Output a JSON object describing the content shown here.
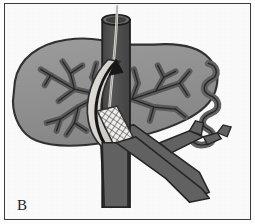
{
  "figure": {
    "panel_label": "B",
    "caption_text": "",
    "type": "grayscale medical line illustration",
    "background_color": "#fbfbfb",
    "frame_color": "#3b3b3b"
  },
  "palette": {
    "liver_fill": "#8f8f8f",
    "liver_outline": "#2e2e2e",
    "vessel_fill": "#5d5d5d",
    "vessel_outline": "#222222",
    "ivc_fill": "#4a4a4a",
    "ivc_outline": "#1c1c1c",
    "shunt_tract_fill": "#d8d6d0",
    "shunt_tract_outline": "#2a2a2a",
    "arrow_color": "#111111",
    "stent_mesh_fill": "#efeeea",
    "stent_mesh_line": "#2b2b2b",
    "guidewire_color": "#dedcd6",
    "page_white": "#ffffff"
  },
  "structures": [
    {
      "id": "liver",
      "name": "liver parenchyma",
      "shade": "#8f8f8f"
    },
    {
      "id": "ivc",
      "name": "inferior vena cava",
      "shade": "#4a4a4a"
    },
    {
      "id": "portal-vein",
      "name": "portal vein and branches",
      "shade": "#5d5d5d"
    },
    {
      "id": "hepatic-veins",
      "name": "hepatic vein branches",
      "shade": "#5d5d5d"
    },
    {
      "id": "biliary-tree",
      "name": "intrahepatic biliary branches",
      "shade": "#5d5d5d"
    },
    {
      "id": "shunt-tract",
      "name": "intrahepatic shunt tract",
      "shade": "#d8d6d0"
    },
    {
      "id": "stent",
      "name": "expanded wire-mesh stent",
      "shade": "#efeeea"
    },
    {
      "id": "guidewire",
      "name": "guidewire in vena cava",
      "shade": "#dedcd6"
    },
    {
      "id": "flow-arrow",
      "name": "direction of blood flow arrow",
      "shade": "#111111"
    },
    {
      "id": "right-organ",
      "name": "adjacent coiled visceral structure",
      "shade": "#5d5d5d"
    }
  ]
}
